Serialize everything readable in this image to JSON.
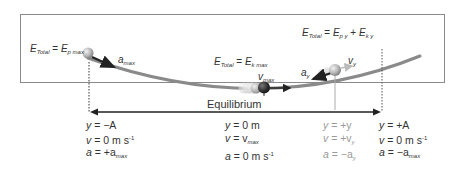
{
  "diagram": {
    "energy_labels": {
      "left": {
        "E": "E",
        "total_sub": "Total",
        "eq": " = ",
        "E2": "E",
        "sub2": "p max"
      },
      "center": {
        "E": "E",
        "total_sub": "Total",
        "eq": " = ",
        "E2": "E",
        "sub2": "k max"
      },
      "right": {
        "E": "E",
        "total_sub": "Total",
        "eq": " = ",
        "E2": "E",
        "sub2": "p y",
        "plus": " + ",
        "E3": "E",
        "sub3": "k y"
      }
    },
    "vector_labels": {
      "a_max": {
        "base": "a",
        "sub": "max"
      },
      "v_max": {
        "base": "v",
        "sub": "max"
      },
      "a_y": {
        "base": "a",
        "sub": "y"
      },
      "v_y": {
        "base": "v",
        "sub": "y"
      }
    },
    "equilibrium_label": "Equilibrium",
    "columns": [
      {
        "position": "left",
        "rows": [
          {
            "lhs": "y",
            "rhs": "= −A"
          },
          {
            "lhs": "v",
            "rhs": "= 0 m s",
            "sup": "-1"
          },
          {
            "lhs": "a",
            "rhs": "= +a",
            "sub": "max"
          }
        ]
      },
      {
        "position": "center",
        "rows": [
          {
            "lhs": "y",
            "rhs": "= 0 m"
          },
          {
            "lhs": "v",
            "rhs": "= v",
            "sub": "max"
          },
          {
            "lhs": "a",
            "rhs": "= 0 m s",
            "sup": "-1"
          }
        ]
      },
      {
        "position": "intermediate",
        "rows": [
          {
            "lhs": "y",
            "rhs": "= +y"
          },
          {
            "lhs": "v",
            "rhs": "= +v",
            "sub": "y"
          },
          {
            "lhs": "a",
            "rhs": "= −a",
            "sub": "y"
          }
        ]
      },
      {
        "position": "right",
        "rows": [
          {
            "lhs": "y",
            "rhs": "= +A"
          },
          {
            "lhs": "v",
            "rhs": "= 0 m s",
            "sup": "-1"
          },
          {
            "lhs": "a",
            "rhs": "= −a",
            "sub": "max"
          }
        ]
      }
    ],
    "colors": {
      "frame": "#8a8a8a",
      "track": "#8a8a8a",
      "arrow": "#222222",
      "muted_text": "#9a9a9a",
      "text": "#333333"
    }
  }
}
